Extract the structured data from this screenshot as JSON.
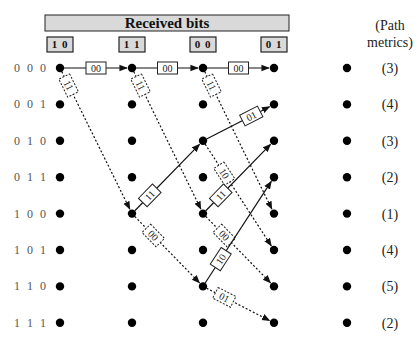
{
  "header": {
    "title": "Received bits"
  },
  "received_bits": [
    "1 0",
    "1 1",
    "0 0",
    "0 1"
  ],
  "metrics_title": [
    "(Path",
    "metrics)"
  ],
  "states": [
    "0 0 0",
    "0 0 1",
    "0 1 0",
    "0 1 1",
    "1 0 0",
    "1 0 1",
    "1 1 0",
    "1 1 1"
  ],
  "path_metrics": [
    "(3)",
    "(4)",
    "(3)",
    "(2)",
    "(1)",
    "(4)",
    "(5)",
    "(2)"
  ],
  "columns": 5,
  "edges": [
    {
      "from_col": 0,
      "from_state": 0,
      "to_col": 1,
      "to_state": 0,
      "label": "00",
      "style": "solid"
    },
    {
      "from_col": 1,
      "from_state": 0,
      "to_col": 2,
      "to_state": 0,
      "label": "00",
      "style": "solid"
    },
    {
      "from_col": 2,
      "from_state": 0,
      "to_col": 3,
      "to_state": 0,
      "label": "00",
      "style": "solid"
    },
    {
      "from_col": 0,
      "from_state": 0,
      "to_col": 1,
      "to_state": 4,
      "label": "11",
      "style": "dotted"
    },
    {
      "from_col": 1,
      "from_state": 0,
      "to_col": 2,
      "to_state": 4,
      "label": "11",
      "style": "dotted"
    },
    {
      "from_col": 2,
      "from_state": 0,
      "to_col": 3,
      "to_state": 4,
      "label": "11",
      "style": "dotted"
    },
    {
      "from_col": 1,
      "from_state": 4,
      "to_col": 2,
      "to_state": 2,
      "label": "11",
      "style": "solid"
    },
    {
      "from_col": 1,
      "from_state": 4,
      "to_col": 2,
      "to_state": 6,
      "label": "00",
      "style": "dotted"
    },
    {
      "from_col": 2,
      "from_state": 2,
      "to_col": 3,
      "to_state": 1,
      "label": "01",
      "style": "solid"
    },
    {
      "from_col": 2,
      "from_state": 2,
      "to_col": 3,
      "to_state": 5,
      "label": "10",
      "style": "dotted"
    },
    {
      "from_col": 2,
      "from_state": 4,
      "to_col": 3,
      "to_state": 2,
      "label": "11",
      "style": "solid"
    },
    {
      "from_col": 2,
      "from_state": 4,
      "to_col": 3,
      "to_state": 6,
      "label": "00",
      "style": "dotted"
    },
    {
      "from_col": 2,
      "from_state": 6,
      "to_col": 3,
      "to_state": 3,
      "label": "10",
      "style": "solid"
    },
    {
      "from_col": 2,
      "from_state": 6,
      "to_col": 3,
      "to_state": 7,
      "label": "01",
      "style": "dotted"
    }
  ]
}
